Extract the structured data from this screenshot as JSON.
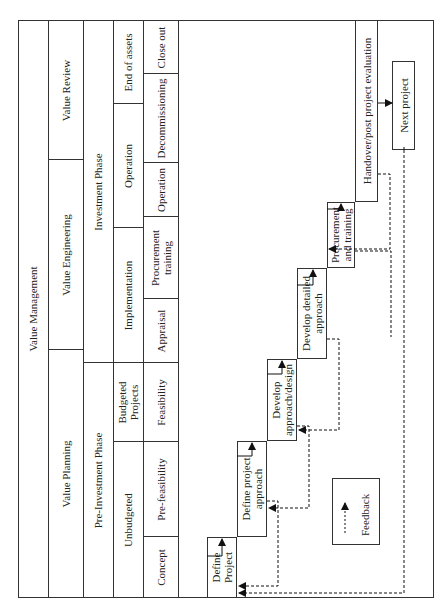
{
  "header": {
    "value_management": "Value Management",
    "value_planning": "Value Planning",
    "value_engineering": "Value Engineering",
    "value_review": "Value Review",
    "pre_investment_phase": "Pre-Investment Phase",
    "investment_phase": "Investment Phase"
  },
  "row3": {
    "unbudgeted": "Unbudgeted",
    "budgeted_projects": "Budgeted Projects",
    "implementation": "Implementation",
    "operation": "Operation",
    "end_of_assets": "End of assets"
  },
  "row4": {
    "concept": "Concept",
    "pre_feasibility": "Pre-feasibility",
    "feasibility": "Feasibility",
    "appraisal": "Appraisal",
    "procurement_training": "Procurement training",
    "operation": "Operation",
    "decommissioning": "Decommissioning",
    "close_out": "Close out"
  },
  "steps": [
    {
      "label": "Define Project"
    },
    {
      "label": "Define project approach"
    },
    {
      "label": "Develop approach/design"
    },
    {
      "label": "Develop detailed approach"
    },
    {
      "label": "Procurement and training"
    },
    {
      "label": "Handover/post project evaluation"
    },
    {
      "label": "Next project"
    }
  ],
  "legend": {
    "label": "Feedback"
  }
}
